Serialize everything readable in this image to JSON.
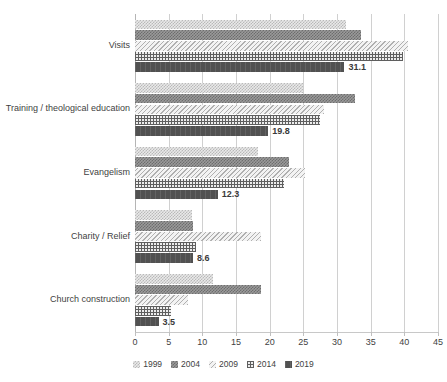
{
  "chart_data": {
    "type": "bar",
    "orientation": "horizontal",
    "title": "",
    "xlabel": "",
    "ylabel": "",
    "xlim": [
      0,
      45
    ],
    "xticks": [
      0,
      5,
      10,
      15,
      20,
      25,
      30,
      35,
      40,
      45
    ],
    "grid": true,
    "legend_position": "bottom",
    "categories": [
      "Visits",
      "Training / theological education",
      "Evangelism",
      "Charity / Relief",
      "Church construction"
    ],
    "series": [
      {
        "name": "1999",
        "values": [
          31.4,
          25.0,
          18.2,
          8.5,
          11.6
        ]
      },
      {
        "name": "2004",
        "values": [
          33.5,
          32.6,
          22.8,
          8.6,
          18.7
        ]
      },
      {
        "name": "2009",
        "values": [
          40.5,
          28.0,
          25.2,
          18.7,
          7.9
        ]
      },
      {
        "name": "2014",
        "values": [
          39.8,
          27.5,
          22.2,
          9.1,
          5.3
        ]
      },
      {
        "name": "2019",
        "values": [
          31.1,
          19.8,
          12.3,
          8.6,
          3.5
        ]
      }
    ],
    "data_labels": {
      "series": "2019",
      "values": [
        "31.1",
        "19.8",
        "12.3",
        "8.6",
        "3.5"
      ]
    },
    "colors": {
      "series_1999": "#e9e9e9",
      "series_2004": "#9a9a9a",
      "series_2009": "#f0f0f0",
      "series_2014": "#ededed",
      "series_2019": "#515151",
      "gridline": "#d0d0d0",
      "text": "#3f3f3f"
    }
  },
  "axis": {
    "tick_labels": [
      "0",
      "5",
      "10",
      "15",
      "20",
      "25",
      "30",
      "35",
      "40",
      "45"
    ]
  },
  "legend": {
    "items": [
      {
        "label": "1999"
      },
      {
        "label": "2004"
      },
      {
        "label": "2009"
      },
      {
        "label": "2014"
      },
      {
        "label": "2019"
      }
    ]
  }
}
